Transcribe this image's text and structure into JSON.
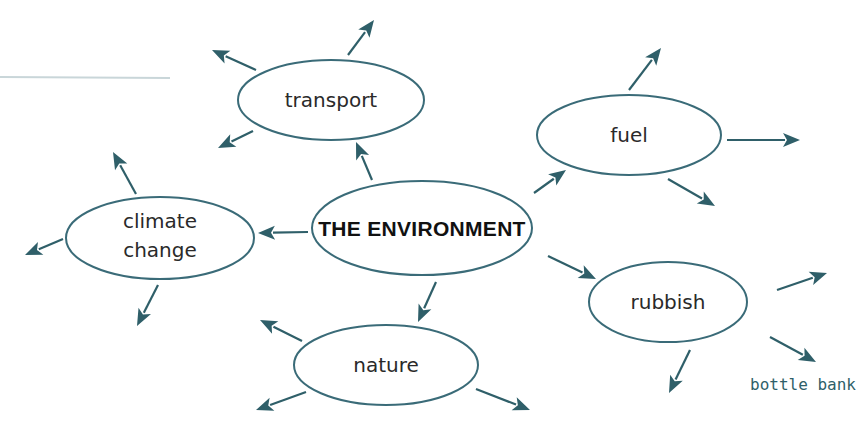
{
  "diagram": {
    "type": "mind-map",
    "colors": {
      "outline": "#3a6b78",
      "arrow": "#2f5f69",
      "text": "#2a2a2a",
      "center_text": "#111111",
      "handwritten": "#2f5f69"
    },
    "center": {
      "label": "THE ENVIRONMENT"
    },
    "topics": [
      {
        "id": "transport",
        "label": "transport"
      },
      {
        "id": "fuel",
        "label": "fuel"
      },
      {
        "id": "climate-change",
        "label_lines": [
          "climate",
          "change"
        ]
      },
      {
        "id": "rubbish",
        "label": "rubbish"
      },
      {
        "id": "nature",
        "label": "nature"
      }
    ],
    "annotations": [
      {
        "attached_to": "rubbish",
        "text": "bottle bank"
      }
    ]
  }
}
